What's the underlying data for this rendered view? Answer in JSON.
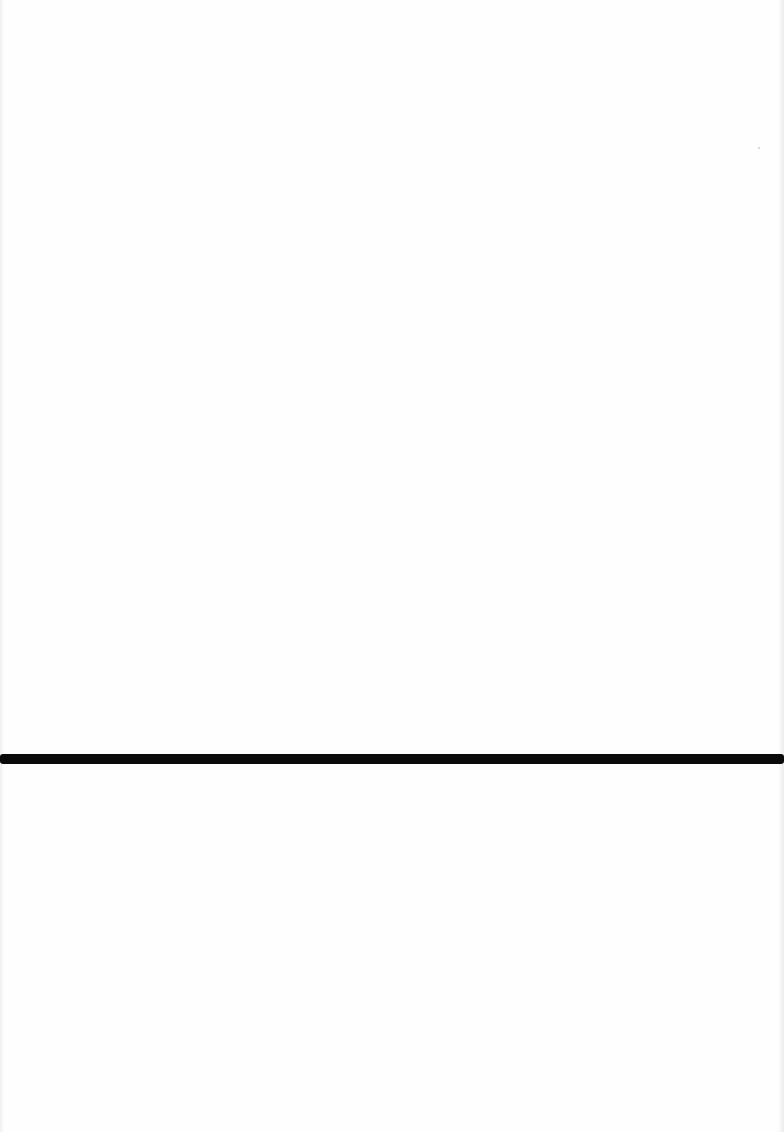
{
  "page": {
    "background_color": "#fefefe",
    "content": "blank page",
    "separator": {
      "kind": "horizontal rule",
      "color": "#0a0a0a"
    }
  }
}
